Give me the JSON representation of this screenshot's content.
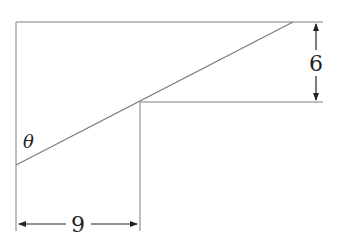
{
  "diagram": {
    "type": "geometry",
    "labels": {
      "theta": "θ",
      "height": "6",
      "width": "9"
    },
    "dimensions": {
      "vertical_measure": 6,
      "horizontal_measure": 9
    },
    "colors": {
      "frame_line": "#a8a8a8",
      "diagonal": "#7a7a7a",
      "arrow": "#222222",
      "text": "#222222"
    }
  }
}
